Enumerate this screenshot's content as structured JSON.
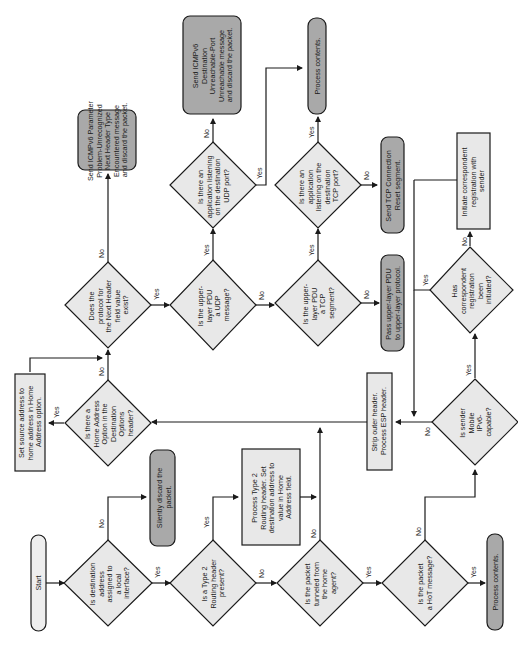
{
  "colors": {
    "decision_fill": "#e8e8e8",
    "process_fill": "#e8e8e8",
    "terminal_dark_fill": "#a9a9a9",
    "terminal_light_fill": "#eeeeee",
    "line": "#1a1a1a"
  },
  "nodes": {
    "start": "Start",
    "d_dest_local": [
      "Is destination",
      "address",
      "assigned to",
      "a local",
      "interface?"
    ],
    "silently_discard": [
      "Silently discard the",
      "packet."
    ],
    "d_type2": [
      "Is a Type 2",
      "Routing header",
      "present?"
    ],
    "process_type2": [
      "Process Type 2",
      "Routing header. Set",
      "destination address to",
      "value in Home",
      "Address field."
    ],
    "d_tunneled": [
      "Is the packet",
      "tunneled from",
      "the home",
      "agent?"
    ],
    "d_hot": [
      "Is the packet",
      "a HoT message?"
    ],
    "process_contents_bottom": "Process contents.",
    "strip_outer": [
      "Strip outer header.",
      "Process ESP header."
    ],
    "d_sender_mipv6": [
      "Is sender",
      "Mobile",
      "IPv6-",
      "capable?"
    ],
    "d_corr_reg": [
      "Has",
      "correspondent",
      "registration",
      "been",
      "initiated?"
    ],
    "initiate_corr": [
      "Initiate correspondent",
      "registration with",
      "sender"
    ],
    "pass_upper": [
      "Pass upper-layer PDU",
      "to upper-layer protocol."
    ],
    "d_tcp": [
      "Is the upper-",
      "layer PDU",
      "a TCP",
      "segment?"
    ],
    "d_udp": [
      "Is the upper-",
      "layer PDU",
      "a UDP",
      "message?"
    ],
    "d_next_header": [
      "Does the",
      "protocol for",
      "the Next Header",
      "field value",
      "exist?"
    ],
    "icmp_param_problem": [
      "Send ICMPv6 Parameter",
      "Problem-Unrecognized",
      "Next Header Type",
      "Encountered message",
      "and discard the packet."
    ],
    "d_udp_listen": [
      "Is there an",
      "application listening",
      "on the destination",
      "UDP port?"
    ],
    "d_tcp_listen": [
      "Is there an",
      "application",
      "listening on the",
      "destination",
      "TCP port?"
    ],
    "icmp_dest_unreach": [
      "Send ICMPv6",
      "Destination",
      "Unreachable-Port",
      "Unreachable message",
      "and discard the packet."
    ],
    "process_contents_top": "Process contents.",
    "tcp_reset": [
      "Send TCP Connection",
      "Reset segment."
    ],
    "d_home_addr_opt": [
      "Is there a",
      "Home Address",
      "Option in the",
      "Destination",
      "Options",
      "header?"
    ],
    "set_source_addr": [
      "Set source address to",
      "home address in Home",
      "Address option."
    ]
  },
  "edge_labels": {
    "yes": "Yes",
    "no": "No"
  }
}
